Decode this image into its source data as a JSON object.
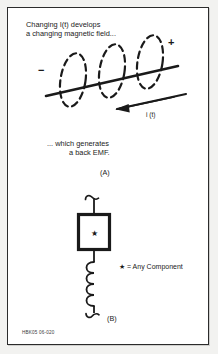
{
  "figure": {
    "title_lines": [
      "Changing I(t) develops",
      "a changing magnetic field..."
    ],
    "mid_lines": [
      "... which generates",
      "a back EMF."
    ],
    "panel_a_label": "(A)",
    "panel_b_label": "(B)",
    "current_label": "i (t)",
    "polarity_plus": "+",
    "polarity_minus": "−",
    "legend_text": "★ = Any Component",
    "footer_code": "HBK05  06-020"
  },
  "colors": {
    "ink": "#1a1a1a",
    "frame": "#2b2b2b",
    "paper": "#ffffff",
    "page_background": "#f2f2f0"
  },
  "panel_a": {
    "description": "Straight conductor drawn diagonally with three dashed elliptical magnetic field loops encircling it; a second diagonal wire below carries a left-pointing current arrow labelled i (t). Polarity signs minus at left and plus at upper right.",
    "field_loop_count": 3,
    "current_arrow_direction": "left"
  },
  "panel_b": {
    "description": "Vertical circuit branch: hooked terminal at top, a heavy square component box containing a star symbol, then a four-turn coil (inductor) below, ending in a hooked terminal.",
    "component_symbol": "★",
    "coil_turns": 4
  }
}
